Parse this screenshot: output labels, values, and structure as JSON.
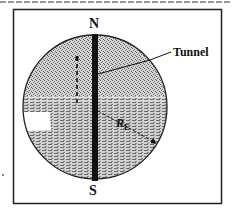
{
  "figure": {
    "labels": {
      "north": "N",
      "south": "S",
      "tunnel": "Tunnel",
      "radius_symbol": "R",
      "radius_subscript": "E"
    },
    "colors": {
      "line": "#1a1a1a",
      "tunnel": "#111111",
      "earth_fill": "#bdbdbd",
      "background": "#ffffff"
    }
  }
}
